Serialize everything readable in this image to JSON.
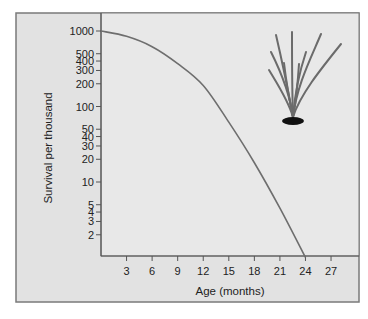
{
  "chart_data": {
    "type": "line",
    "title": "",
    "xlabel": "Age (months)",
    "ylabel": "Survival per thousand",
    "yscale": "log",
    "xlim": [
      0,
      30
    ],
    "ylim": [
      1,
      1740
    ],
    "grid": false,
    "legend": "none",
    "x_ticks": [
      3,
      6,
      9,
      12,
      15,
      18,
      21,
      24,
      27
    ],
    "x_tick_labels": [
      "3",
      "6",
      "9",
      "12",
      "15",
      "18",
      "21",
      "24",
      "27"
    ],
    "y_ticks": [
      1000,
      500,
      400,
      300,
      200,
      100,
      50,
      40,
      30,
      20,
      10,
      5,
      4,
      3,
      2
    ],
    "y_tick_labels": [
      "1000",
      "500",
      "400",
      "300",
      "200",
      "100",
      "50",
      "40",
      "30",
      "20",
      "10",
      "5",
      "4",
      "3",
      "2"
    ],
    "series": [
      {
        "name": "Survivorship",
        "color": "#6e6e6e",
        "x": [
          0,
          3,
          6,
          9,
          12,
          15,
          18,
          21,
          24
        ],
        "y": [
          1000,
          850,
          620,
          370,
          190,
          62,
          18,
          4.5,
          1
        ]
      }
    ],
    "annotations": [
      {
        "type": "illustration",
        "name": "grass-plant-icon",
        "position": "top-right"
      }
    ]
  },
  "colors": {
    "panel_bg": "#e2e2e2",
    "plot_bg": "#e8e8e8",
    "frame": "#7a7a7a",
    "axis": "#555555",
    "plant_leaf": "#6b6b6b",
    "plant_base": "#111111"
  }
}
